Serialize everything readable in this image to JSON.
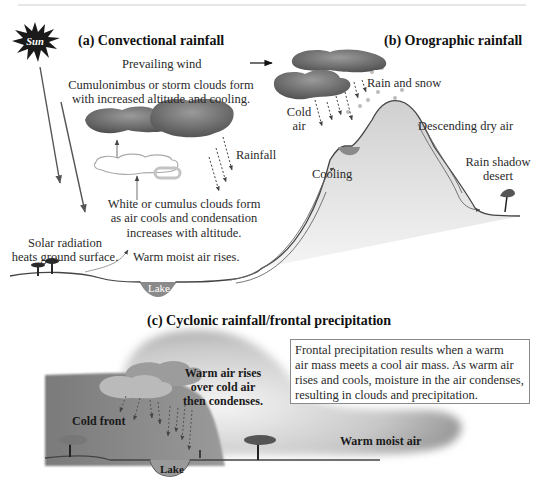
{
  "panels": {
    "convectional": {
      "title": "(a)  Convectional rainfall",
      "sun_label": "Sun",
      "cumulonimbus": [
        "Cumulonimbus or storm clouds form",
        "with increased altitude and cooling."
      ],
      "rainfall": "Rainfall",
      "cumulus": [
        "White or cumulus clouds form",
        "as air cools and condensation",
        "increases with altitude."
      ],
      "solar": [
        "Solar radiation",
        "heats ground surface."
      ],
      "warm_air": "Warm moist air rises.",
      "lake": "Lake"
    },
    "orographic": {
      "title": "(b)  Orographic rainfall",
      "prevailing_wind": "Prevailing wind",
      "rain_snow": "Rain and snow",
      "cold_air": [
        "Cold",
        "air"
      ],
      "cooling": "Cooling",
      "descending": "Descending dry air",
      "rain_shadow": [
        "Rain shadow",
        "desert"
      ]
    },
    "cyclonic": {
      "title": "(c)  Cyclonic rainfall/frontal precipitation",
      "info": [
        "Frontal precipitation results when a warm",
        "air mass meets a cool air mass. As warm air",
        "rises and cools, moisture in the air condenses,",
        "resulting in clouds and precipitation."
      ],
      "warm_rises": [
        "Warm air rises",
        "over cold air",
        "then condenses."
      ],
      "cold_front": "Cold front",
      "warm_moist": "Warm moist air",
      "lake": "Lake"
    }
  },
  "colors": {
    "storm_cloud": "#6f6f6f",
    "cold_air_mass": "#8c8c8c",
    "warm_air_mass": "#bdbdbd",
    "lake": "#8a8a8a",
    "ground_line": "#444444"
  }
}
